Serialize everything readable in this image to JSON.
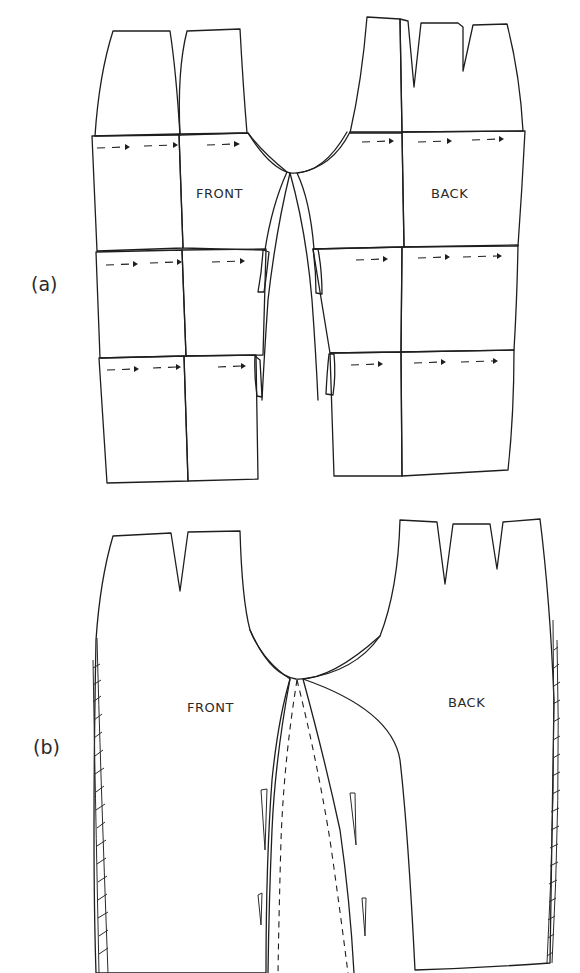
{
  "figure": {
    "stroke_color": "#1e1e1e",
    "background_color": "#ffffff"
  },
  "part_a": {
    "label": "(a)",
    "front_label": "FRONT",
    "back_label": "BACK",
    "rows": 3,
    "front_columns": 2,
    "back_columns": 2,
    "grain_arrows": {
      "front_row1": 3,
      "front_row2": 3,
      "front_row3": 3,
      "back_row1": 3,
      "back_row2": 3,
      "back_row3": 3
    }
  },
  "part_b": {
    "label": "(b)",
    "front_label": "FRONT",
    "back_label": "BACK",
    "front_darts": 1,
    "back_darts": 2,
    "hatched_side_seams": true,
    "dashed_inseam_lines": 2
  }
}
